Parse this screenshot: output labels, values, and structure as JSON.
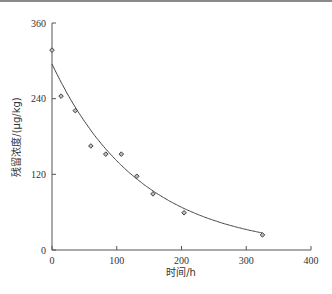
{
  "chart_data": {
    "type": "scatter",
    "title": "",
    "xlabel": "时间/h",
    "ylabel": "残留浓度/(μg/kg)",
    "xlim": [
      0,
      400
    ],
    "ylim": [
      0,
      360
    ],
    "xticks": [
      0,
      100,
      200,
      300,
      400
    ],
    "yticks": [
      0,
      120,
      240,
      360
    ],
    "grid": false,
    "legend": null,
    "series": [
      {
        "name": "measured",
        "kind": "scatter",
        "marker": "diamond",
        "x": [
          0,
          14,
          36,
          60,
          83,
          107,
          131,
          156,
          204,
          325
        ],
        "y": [
          317,
          244,
          221,
          165,
          152,
          152,
          117,
          89,
          59,
          24
        ]
      },
      {
        "name": "fitted",
        "kind": "line",
        "model": "C = 295·e^(-0.00735·t)",
        "c0": 295,
        "k": 0.00735,
        "x_range": [
          0,
          325
        ]
      }
    ]
  }
}
